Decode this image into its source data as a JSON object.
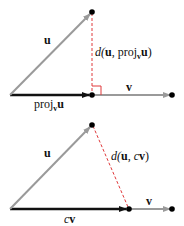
{
  "diagram": {
    "top": {
      "label_u": "u",
      "label_v": "v",
      "label_proj": "proj",
      "label_proj_sub": "v",
      "label_proj_u": "u",
      "label_dist_prefix": "d(",
      "label_dist_u": "u",
      "label_dist_mid": ", proj",
      "label_dist_sub": "v",
      "label_dist_u2": "u",
      "label_dist_suffix": ")"
    },
    "bottom": {
      "label_u": "u",
      "label_v": "v",
      "label_cv_c": "c",
      "label_cv_v": "v",
      "label_dist_prefix": "d(",
      "label_dist_u": "u",
      "label_dist_mid": ", ",
      "label_dist_c": "c",
      "label_dist_v": "v",
      "label_dist_suffix": ")"
    },
    "colors": {
      "u_vector": "#9a9a9a",
      "v_vector": "#9a9a9a",
      "proj_vector": "#111111",
      "distance": "#e0383a",
      "points": "#000000"
    }
  }
}
